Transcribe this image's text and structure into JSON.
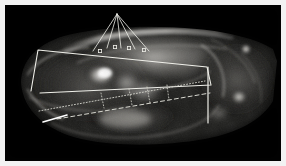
{
  "figure": {
    "title": "",
    "kind": "lateral-radiograph",
    "frame_color": "#ffffff",
    "background_color": "#000000",
    "annotation_color": "#f0f0ea",
    "annotation_dotted_color": "#d8d8d0",
    "width": 286,
    "height": 166
  },
  "radiograph": {
    "modality": "X-ray",
    "view": "lateral",
    "description": "Grayscale lateral radiograph of a rodent skull, snout to the left and cranial base / occiput to the right; bright calvarial roof arcs across the upper half, molar roots and mandibular body are radio-opaque in the centre and lower-left.",
    "bright_landmarks": [
      "calvarial-roof",
      "molar-region",
      "tympanic-bulla",
      "occipital-condyle",
      "incisor-alveolus"
    ],
    "gradient_stops": [
      {
        "name": "deep-background",
        "hex": "#040404"
      },
      {
        "name": "soft-tissue",
        "hex": "#2a2a28"
      },
      {
        "name": "mid-bone",
        "hex": "#767472"
      },
      {
        "name": "dense-bone",
        "hex": "#d8d6d2"
      },
      {
        "name": "highlight",
        "hex": "#fdfcf8"
      }
    ]
  },
  "annotations": {
    "fan": {
      "name": "measurement-fan",
      "apex": {
        "x": 112,
        "y": 9
      },
      "stroke_width": 0.8,
      "endpoints": [
        {
          "x": 88,
          "y": 46
        },
        {
          "x": 102,
          "y": 43
        },
        {
          "x": 116,
          "y": 43
        },
        {
          "x": 130,
          "y": 44
        },
        {
          "x": 144,
          "y": 46
        }
      ]
    },
    "markers": {
      "name": "landmark-markers",
      "shape": "square",
      "size": 3.2,
      "points": [
        {
          "x": 95,
          "y": 46
        },
        {
          "x": 110,
          "y": 42
        },
        {
          "x": 124,
          "y": 43
        },
        {
          "x": 139,
          "y": 45
        }
      ]
    },
    "quadrilateral": {
      "name": "occlusal-plane-quadrilateral",
      "stroke_width": 1.1,
      "points": [
        {
          "x": 26,
          "y": 86
        },
        {
          "x": 33,
          "y": 45
        },
        {
          "x": 202,
          "y": 62
        },
        {
          "x": 206,
          "y": 80
        },
        {
          "x": 35,
          "y": 88
        }
      ]
    },
    "vertical_line": {
      "name": "posterior-vertical-reference",
      "stroke_width": 1.2,
      "x": 203,
      "y_top": 62,
      "y_bottom": 118
    },
    "dotted_lines": [
      {
        "name": "mandibular-dotted-line-upper",
        "stroke_width": 0.9,
        "dash": "1 2",
        "from": {
          "x": 34,
          "y": 106
        },
        "to": {
          "x": 200,
          "y": 76
        }
      },
      {
        "name": "mandibular-dashed-line-lower",
        "stroke_width": 1.0,
        "dash": "4 3",
        "from": {
          "x": 52,
          "y": 114
        },
        "to": {
          "x": 205,
          "y": 88
        }
      }
    ],
    "short_segment": {
      "name": "ramus-short-segment",
      "stroke_width": 1.6,
      "from": {
        "x": 38,
        "y": 117
      },
      "to": {
        "x": 62,
        "y": 110
      }
    },
    "ticks": {
      "name": "measurement-ticks",
      "stroke_width": 0.8,
      "segments": [
        {
          "from": {
            "x": 96,
            "y": 88
          },
          "to": {
            "x": 99,
            "y": 103
          }
        },
        {
          "from": {
            "x": 124,
            "y": 84
          },
          "to": {
            "x": 127,
            "y": 100
          }
        },
        {
          "from": {
            "x": 142,
            "y": 82
          },
          "to": {
            "x": 145,
            "y": 98
          }
        },
        {
          "from": {
            "x": 162,
            "y": 80
          },
          "to": {
            "x": 164,
            "y": 95
          }
        }
      ]
    }
  }
}
